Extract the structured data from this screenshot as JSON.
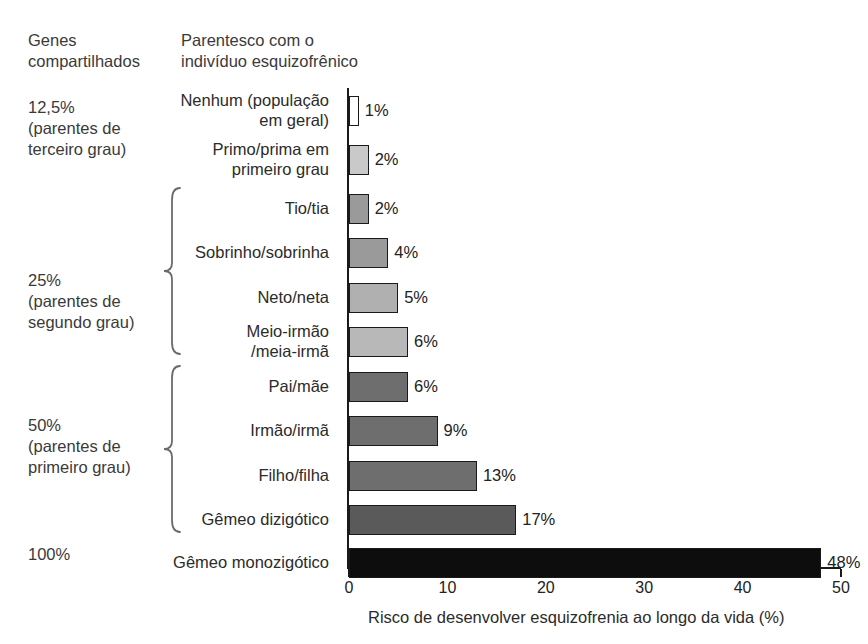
{
  "headers": {
    "genes_shared": "Genes\ncompartilhados",
    "relationship": "Parentesco com o\nindivíduo esquizofrênico"
  },
  "groups": [
    {
      "label": "12,5%\n(parentes de\nterceiro grau)",
      "brace": false
    },
    {
      "label": "25%\n(parentes de\nsegundo grau)",
      "brace": true
    },
    {
      "label": "50%\n(parentes de\nprimeiro grau)",
      "brace": true
    },
    {
      "label": "100%",
      "brace": false
    }
  ],
  "chart_data": {
    "type": "bar",
    "orientation": "horizontal",
    "title": "",
    "xlabel": "Risco de desenvolver esquizofrenia ao longo da vida (%)",
    "ylabel": "",
    "xlim": [
      0,
      50
    ],
    "xticks": [
      0,
      10,
      20,
      30,
      40,
      50
    ],
    "xtick_labels": [
      "0",
      "10",
      "20",
      "30",
      "40",
      "50"
    ],
    "grid": false,
    "legend": false,
    "categories": [
      "Nenhum (população\nem geral)",
      "Primo/prima em\nprimeiro grau",
      "Tio/tia",
      "Sobrinho/sobrinha",
      "Neto/neta",
      "Meio-irmão\n/meia-irmã",
      "Pai/mãe",
      "Irmão/irmã",
      "Filho/filha",
      "Gêmeo dizigótico",
      "Gêmeo monozigótico"
    ],
    "values": [
      1,
      2,
      2,
      4,
      5,
      6,
      6,
      9,
      13,
      17,
      48
    ],
    "value_labels": [
      "1%",
      "2%",
      "2%",
      "4%",
      "5%",
      "6%",
      "6%",
      "9%",
      "13%",
      "17%",
      "48%"
    ],
    "bar_colors": [
      "#ffffff",
      "#c9c9c9",
      "#9a9a9a",
      "#9a9a9a",
      "#b0b0b0",
      "#b8b8b8",
      "#6e6e6e",
      "#6e6e6e",
      "#6e6e6e",
      "#5a5a5a",
      "#0d0d0d"
    ],
    "genes_shared_by_category": [
      "12,5%",
      "12,5%",
      "25%",
      "25%",
      "25%",
      "25%",
      "50%",
      "50%",
      "50%",
      "50%",
      "100%"
    ]
  },
  "colors": {
    "axis": "#1a1a1a",
    "text": "#2b2b2b",
    "brace": "#6b6b6b",
    "background": "#ffffff"
  }
}
